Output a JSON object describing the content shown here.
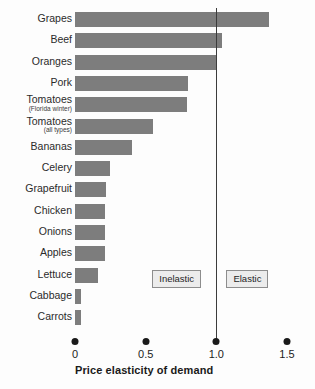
{
  "chart_data": {
    "type": "bar",
    "orientation": "horizontal",
    "title": "",
    "xlabel": "Price elasticity of demand",
    "ylabel": "",
    "xlim": [
      0,
      1.5
    ],
    "xticks": [
      "0",
      "0.5",
      "1.0",
      "1.5"
    ],
    "xtick_values": [
      0,
      0.5,
      1.0,
      1.5
    ],
    "grid": false,
    "legend": "none",
    "categories": [
      "Grapes",
      "Beef",
      "Oranges",
      "Pork",
      "Tomatoes",
      "Tomatoes",
      "Bananas",
      "Celery",
      "Grapefruit",
      "Chicken",
      "Onions",
      "Apples",
      "Lettuce",
      "Cabbage",
      "Carrots"
    ],
    "sublabels": [
      "",
      "",
      "",
      "",
      "(Florida winter)",
      "(all types)",
      "",
      "",
      "",
      "",
      "",
      "",
      "",
      "",
      ""
    ],
    "values": [
      1.37,
      1.04,
      1.0,
      0.8,
      0.79,
      0.55,
      0.4,
      0.25,
      0.22,
      0.21,
      0.21,
      0.21,
      0.16,
      0.04,
      0.04
    ],
    "annotations": [
      {
        "text": "Inelastic",
        "x": 0.72
      },
      {
        "text": "Elastic",
        "x": 1.22
      }
    ],
    "reference_line": {
      "value": 1.0,
      "label": "unit elastic"
    },
    "bar_color": "#7d7d7d",
    "axis_color": "#1a1a1a",
    "reference_line_color": "#3c3c3c",
    "annotation_fill": "#ececec",
    "annotation_border": "#8d8d8d",
    "background": "#fdfdfd"
  }
}
